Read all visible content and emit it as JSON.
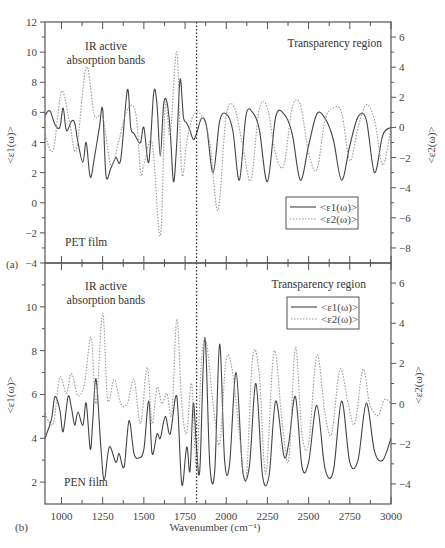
{
  "chart_data": [
    {
      "panel": "a",
      "panel_label": "(a)",
      "type": "line",
      "film_label": "PET film",
      "annotation_left": [
        "IR active",
        "absorption bands"
      ],
      "annotation_right": "Transparency region",
      "xlabel": "",
      "xlim": [
        900,
        3000
      ],
      "ylabel_left": "<ε1(ω)>",
      "ylabel_right": "<ε2(ω)>",
      "ylim_left": [
        -4,
        12
      ],
      "ylim_right": [
        -9,
        7
      ],
      "yticks_left": [
        -4,
        -2,
        0,
        2,
        4,
        6,
        8,
        10,
        12
      ],
      "yticks_right": [
        -8,
        -6,
        -4,
        -2,
        0,
        2,
        4,
        6
      ],
      "vertical_marker_x": 1820,
      "legend": [
        "<ε1(ω)>",
        "<ε2(ω)>"
      ],
      "legend_position": "lower right",
      "series": [
        {
          "name": "<ε1(ω)>",
          "axis": "left",
          "style": "solid",
          "x": [
            900,
            930,
            960,
            990,
            1010,
            1030,
            1060,
            1080,
            1100,
            1130,
            1150,
            1175,
            1200,
            1230,
            1250,
            1270,
            1300,
            1330,
            1360,
            1400,
            1420,
            1440,
            1460,
            1480,
            1500,
            1530,
            1560,
            1580,
            1600,
            1620,
            1640,
            1660,
            1680,
            1700,
            1720,
            1740,
            1760,
            1780,
            1800,
            1820,
            1850,
            1880,
            1920,
            1960,
            2000,
            2040,
            2080,
            2120,
            2160,
            2200,
            2250,
            2300,
            2350,
            2400,
            2450,
            2500,
            2550,
            2600,
            2650,
            2700,
            2750,
            2800,
            2850,
            2900,
            2950,
            3000
          ],
          "values": [
            5.8,
            6.1,
            5.2,
            5.0,
            6.3,
            4.8,
            5.4,
            5.3,
            4.0,
            2.7,
            4.0,
            1.7,
            3.0,
            5.0,
            6.2,
            1.8,
            2.3,
            3.0,
            2.9,
            7.5,
            5.0,
            4.6,
            4.2,
            4.0,
            5.0,
            2.7,
            7.3,
            6.5,
            3.1,
            6.5,
            6.7,
            4.8,
            1.4,
            4.0,
            8.2,
            5.7,
            5.3,
            4.8,
            4.2,
            4.6,
            5.6,
            5.1,
            2.0,
            5.4,
            5.9,
            4.8,
            1.5,
            5.8,
            6.0,
            4.9,
            1.4,
            5.7,
            5.9,
            4.6,
            1.5,
            3.8,
            5.9,
            5.6,
            4.2,
            1.5,
            3.8,
            5.7,
            5.5,
            2.0,
            4.5,
            5.0
          ]
        },
        {
          "name": "<ε2(ω)>",
          "axis": "right",
          "style": "dotted",
          "x": [
            900,
            950,
            1000,
            1050,
            1090,
            1150,
            1200,
            1250,
            1300,
            1350,
            1400,
            1450,
            1480,
            1500,
            1550,
            1600,
            1630,
            1660,
            1700,
            1730,
            1760,
            1800,
            1850,
            1900,
            1950,
            2000,
            2050,
            2100,
            2150,
            2200,
            2250,
            2300,
            2350,
            2400,
            2450,
            2500,
            2550,
            2600,
            2650,
            2700,
            2750,
            2800,
            2850,
            2900,
            2950,
            3000
          ],
          "values": [
            -0.5,
            -1.5,
            2.4,
            0.3,
            -1.5,
            4.0,
            0.8,
            0.7,
            -2.5,
            -0.8,
            1.2,
            1.0,
            -3.0,
            -2.5,
            -1.0,
            -7.2,
            1.5,
            -0.5,
            5.0,
            -3.0,
            -1.0,
            0.8,
            0.8,
            -1.0,
            -5.5,
            0.8,
            1.3,
            -1.2,
            -3.5,
            1.2,
            1.3,
            -1.8,
            -2.5,
            1.3,
            1.5,
            -1.7,
            -2.8,
            0.5,
            1.3,
            1.0,
            -2.2,
            0.0,
            1.5,
            0.5,
            -2.5,
            0.0
          ]
        }
      ]
    },
    {
      "panel": "b",
      "panel_label": "(b)",
      "type": "line",
      "film_label": "PEN film",
      "annotation_left": [
        "IR active",
        "absorption bands"
      ],
      "annotation_right": "Transparency region",
      "xlabel": "Wavenumber (cm⁻¹)",
      "xlim": [
        900,
        3000
      ],
      "xticks": [
        1000,
        1250,
        1500,
        1750,
        2000,
        2250,
        2500,
        2750,
        3000
      ],
      "ylabel_left": "<ε1(ω)>",
      "ylabel_right": "<ε2(ω)>",
      "ylim_left": [
        1,
        12
      ],
      "ylim_right": [
        -5,
        7
      ],
      "yticks_left": [
        2,
        4,
        6,
        8,
        10
      ],
      "yticks_right": [
        -4,
        -2,
        0,
        2,
        4,
        6
      ],
      "vertical_marker_x": 1820,
      "legend": [
        "<ε1(ω)>",
        "<ε2(ω)>"
      ],
      "legend_position": "upper right",
      "series": [
        {
          "name": "<ε1(ω)>",
          "axis": "left",
          "style": "solid",
          "x": [
            900,
            940,
            960,
            990,
            1010,
            1040,
            1060,
            1080,
            1100,
            1130,
            1150,
            1175,
            1190,
            1210,
            1240,
            1260,
            1290,
            1330,
            1350,
            1380,
            1410,
            1440,
            1470,
            1500,
            1530,
            1550,
            1580,
            1600,
            1630,
            1660,
            1700,
            1730,
            1760,
            1780,
            1800,
            1820,
            1840,
            1870,
            1900,
            1930,
            1960,
            1990,
            2020,
            2060,
            2100,
            2140,
            2180,
            2220,
            2260,
            2300,
            2350,
            2380,
            2420,
            2460,
            2500,
            2550,
            2600,
            2650,
            2700,
            2750,
            2800,
            2850,
            2900,
            2950,
            3000
          ],
          "values": [
            4.0,
            4.9,
            5.9,
            5.3,
            4.3,
            5.9,
            5.4,
            4.6,
            5.2,
            4.6,
            5.6,
            3.5,
            4.8,
            6.7,
            3.5,
            2.1,
            3.6,
            2.9,
            3.3,
            2.7,
            4.8,
            3.3,
            3.1,
            3.5,
            5.7,
            3.3,
            4.2,
            4.0,
            5.0,
            4.2,
            5.9,
            1.9,
            3.6,
            2.5,
            5.6,
            3.5,
            2.6,
            8.6,
            2.8,
            2.5,
            8.3,
            3.0,
            2.8,
            7.0,
            2.5,
            2.7,
            6.5,
            2.3,
            2.3,
            5.7,
            3.2,
            3.8,
            5.9,
            2.7,
            2.9,
            5.5,
            2.6,
            2.5,
            5.7,
            2.9,
            3.0,
            5.6,
            3.4,
            3.0,
            4.0
          ]
        },
        {
          "name": "<ε2(ω)>",
          "axis": "right",
          "style": "dotted",
          "x": [
            900,
            950,
            990,
            1030,
            1060,
            1100,
            1140,
            1180,
            1210,
            1250,
            1280,
            1320,
            1360,
            1400,
            1440,
            1480,
            1520,
            1550,
            1580,
            1610,
            1640,
            1670,
            1700,
            1730,
            1760,
            1790,
            1820,
            1850,
            1880,
            1920,
            1960,
            2000,
            2040,
            2080,
            2120,
            2160,
            2200,
            2240,
            2290,
            2340,
            2380,
            2420,
            2460,
            2500,
            2550,
            2600,
            2640,
            2690,
            2740,
            2780,
            2830,
            2870,
            2920,
            2960,
            3000
          ],
          "values": [
            -0.5,
            -1.0,
            1.3,
            0.5,
            1.5,
            0.4,
            1.0,
            3.3,
            0.0,
            4.5,
            0.2,
            1.2,
            0.0,
            0.0,
            1.2,
            -1.0,
            1.8,
            -1.0,
            0.8,
            0.0,
            0.5,
            -0.5,
            4.2,
            0.0,
            -1.5,
            1.0,
            -3.2,
            2.2,
            3.0,
            0.0,
            -2.0,
            2.2,
            1.5,
            -1.5,
            -3.8,
            2.3,
            1.5,
            -3.5,
            2.6,
            -1.0,
            -2.8,
            2.8,
            -1.5,
            -2.0,
            2.4,
            -0.5,
            -1.5,
            1.7,
            0.0,
            -1.0,
            1.7,
            0.0,
            -0.6,
            0.2,
            0.0
          ]
        }
      ]
    }
  ]
}
